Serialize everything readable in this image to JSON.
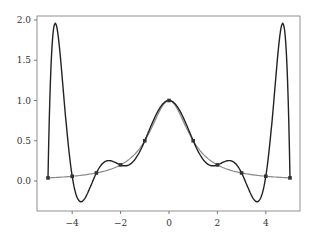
{
  "chart_data": {
    "type": "line",
    "title": "",
    "xlabel": "",
    "ylabel": "",
    "xlim": [
      -5.5,
      5.5
    ],
    "ylim": [
      -0.38,
      2.05
    ],
    "xticks": [
      -4,
      -2,
      0,
      2,
      4
    ],
    "xtick_labels": [
      "−4",
      "−2",
      "0",
      "2",
      "4"
    ],
    "yticks": [
      0.0,
      0.5,
      1.0,
      1.5,
      2.0
    ],
    "ytick_labels": [
      "0.0",
      "0.5",
      "1.0",
      "1.5",
      "2.0"
    ],
    "grid": false,
    "legend": null,
    "series": [
      {
        "name": "f(x) = 1/(1+x^2)",
        "style": "smooth line",
        "color": "#888888",
        "x": [
          -5,
          -4,
          -3,
          -2,
          -1,
          0,
          1,
          2,
          3,
          4,
          5
        ],
        "values": [
          0.038,
          0.059,
          0.1,
          0.2,
          0.5,
          1.0,
          0.5,
          0.2,
          0.1,
          0.059,
          0.038
        ]
      },
      {
        "name": "degree-10 interpolating polynomial",
        "style": "line",
        "color": "#222222",
        "x": [
          -5,
          -4.8,
          -4.5,
          -4,
          -3.6,
          -3,
          -2.5,
          -2,
          -1,
          0,
          1,
          2,
          2.5,
          3,
          3.6,
          4,
          4.5,
          4.8,
          5
        ],
        "values": [
          0.038,
          1.92,
          1.2,
          0.059,
          -0.25,
          0.1,
          0.25,
          0.2,
          0.5,
          1.0,
          0.5,
          0.2,
          0.25,
          0.1,
          -0.25,
          0.059,
          1.2,
          1.92,
          0.038
        ]
      },
      {
        "name": "interpolation nodes",
        "style": "markers",
        "color": "#222222",
        "x": [
          -5,
          -4,
          -3,
          -2,
          -1,
          0,
          1,
          2,
          3,
          4,
          5
        ],
        "values": [
          0.038,
          0.059,
          0.1,
          0.2,
          0.5,
          1.0,
          0.5,
          0.2,
          0.1,
          0.059,
          0.038
        ]
      }
    ]
  }
}
